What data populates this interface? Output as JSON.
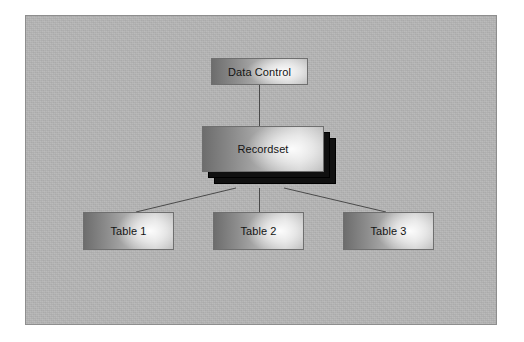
{
  "diagram": {
    "frame": {
      "border_color": "#8e8e8e",
      "background_color": "#b6b6b6"
    },
    "nodes": [
      {
        "id": "data-control",
        "label": "Data Control"
      },
      {
        "id": "recordset",
        "label": "Recordset"
      },
      {
        "id": "table-1",
        "label": "Table 1"
      },
      {
        "id": "table-2",
        "label": "Table 2"
      },
      {
        "id": "table-3",
        "label": "Table 3"
      }
    ],
    "connectors": [
      {
        "from": "data-control",
        "to": "recordset"
      },
      {
        "from": "recordset",
        "to": "table-1"
      },
      {
        "from": "recordset",
        "to": "table-2"
      },
      {
        "from": "recordset",
        "to": "table-3"
      }
    ],
    "colors": {
      "node_border": "#6f6f6f",
      "node_gradient_dark": "#6d6d6d",
      "node_gradient_light": "#cfcfcf",
      "node_highlight": "#ffffff",
      "stack_shadow": "#101010",
      "connector_line": "#4a4a4a",
      "label_text": "#141414"
    }
  }
}
